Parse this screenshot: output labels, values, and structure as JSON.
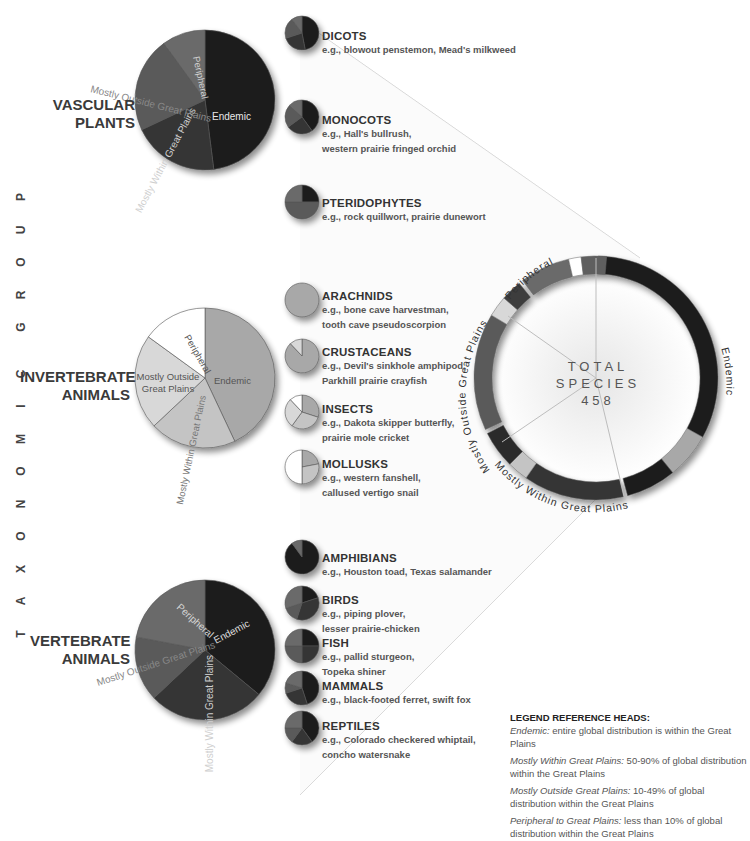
{
  "axis_title": "TAXONOMIC GROUP",
  "colors": {
    "endemic_dark": "#1e1e1e",
    "within_dark": "#353535",
    "outside_dark": "#5a5a5a",
    "peripheral_dark": "#6a6a6a",
    "endemic_light": "#a8a8a8",
    "within_light": "#c4c4c4",
    "outside_light": "#d8d8d8",
    "peripheral_light": "#ffffff"
  },
  "groups": [
    {
      "label_line1": "VASCULAR",
      "label_line2": "PLANTS",
      "slice_labels": [
        "Endemic",
        "Mostly Within Great Plains",
        "Mostly Outside Great Plains",
        "Peripheral"
      ],
      "subgroups": [
        {
          "name": "DICOTS",
          "ex1": "e.g., blowout penstemon, Mead's milkweed",
          "ex2": ""
        },
        {
          "name": "MONOCOTS",
          "ex1": "e.g., Hall's bullrush,",
          "ex2": "western prairie fringed orchid"
        },
        {
          "name": "PTERIDOPHYTES",
          "ex1": "e.g., rock quillwort, prairie dunewort",
          "ex2": ""
        }
      ]
    },
    {
      "label_line1": "INVERTEBRATE",
      "label_line2": "ANIMALS",
      "slice_labels": [
        "Endemic",
        "Mostly Within Great Plains",
        "Mostly Outside",
        "Great Plains",
        "Peripheral"
      ],
      "subgroups": [
        {
          "name": "ARACHNIDS",
          "ex1": "e.g., bone cave harvestman,",
          "ex2": "tooth cave pseudoscorpion"
        },
        {
          "name": "CRUSTACEANS",
          "ex1": "e.g., Devil's sinkhole amphipod,",
          "ex2": "Parkhill prairie crayfish"
        },
        {
          "name": "INSECTS",
          "ex1": "e.g., Dakota skipper butterfly,",
          "ex2": "prairie mole cricket"
        },
        {
          "name": "MOLLUSKS",
          "ex1": "e.g., western fanshell,",
          "ex2": "callused vertigo snail"
        }
      ]
    },
    {
      "label_line1": "VERTEBRATE",
      "label_line2": "ANIMALS",
      "slice_labels": [
        "Endemic",
        "Mostly Within Great Plains",
        "Mostly Outside Great Plains",
        "Peripheral"
      ],
      "subgroups": [
        {
          "name": "AMPHIBIANS",
          "ex1": "e.g., Houston toad, Texas salamander",
          "ex2": ""
        },
        {
          "name": "BIRDS",
          "ex1": "e.g., piping plover,",
          "ex2": "lesser prairie-chicken"
        },
        {
          "name": "FISH",
          "ex1": "e.g., pallid sturgeon,",
          "ex2": "Topeka shiner"
        },
        {
          "name": "MAMMALS",
          "ex1": "e.g., black-footed ferret, swift fox",
          "ex2": ""
        },
        {
          "name": "REPTILES",
          "ex1": "e.g., Colorado checkered whiptail,",
          "ex2": "concho watersnake"
        }
      ]
    }
  ],
  "total": {
    "line1": "TOTAL",
    "line2": "SPECIES",
    "value": "458",
    "ring_labels": {
      "endemic": "Endemic",
      "within": "Mostly Within Great Plains",
      "outside": "Mostly Outside Great Plains",
      "peripheral": "Peripheral"
    }
  },
  "legend": {
    "head": "LEGEND REFERENCE HEADS:",
    "items": [
      {
        "term": "Endemic:",
        "desc": " entire global distribution is within the Great Plains"
      },
      {
        "term": "Mostly Within Great Plains:",
        "desc": " 50-90% of global distribution within the Great Plains"
      },
      {
        "term": "Mostly Outside Great Plains:",
        "desc": " 10-49% of global distribution within the Great Plains"
      },
      {
        "term": "Peripheral to Great Plains:",
        "desc": " less than 10% of global distribution within the Great Plains"
      }
    ]
  },
  "chart_data": {
    "type": "pie",
    "categories": [
      "Endemic",
      "Mostly Within Great Plains",
      "Mostly Outside Great Plains",
      "Peripheral"
    ],
    "total_species": 458,
    "group_pies": [
      {
        "name": "Vascular Plants",
        "values": [
          48,
          20,
          22,
          10
        ]
      },
      {
        "name": "Invertebrate Animals",
        "values": [
          43,
          20,
          22,
          15
        ]
      },
      {
        "name": "Vertebrate Animals",
        "values": [
          36,
          27,
          15,
          22
        ]
      }
    ],
    "subgroup_pies": [
      {
        "name": "Dicots",
        "group": "Vascular Plants",
        "values": [
          47,
          23,
          20,
          10
        ]
      },
      {
        "name": "Monocots",
        "group": "Vascular Plants",
        "values": [
          40,
          25,
          22,
          13
        ]
      },
      {
        "name": "Pteridophytes",
        "group": "Vascular Plants",
        "values": [
          25,
          0,
          50,
          25
        ]
      },
      {
        "name": "Arachnids",
        "group": "Invertebrate Animals",
        "values": [
          100,
          0,
          0,
          0
        ]
      },
      {
        "name": "Crustaceans",
        "group": "Invertebrate Animals",
        "values": [
          88,
          0,
          12,
          0
        ]
      },
      {
        "name": "Insects",
        "group": "Invertebrate Animals",
        "values": [
          30,
          30,
          28,
          12
        ]
      },
      {
        "name": "Mollusks",
        "group": "Invertebrate Animals",
        "values": [
          22,
          28,
          0,
          50
        ]
      },
      {
        "name": "Amphibians",
        "group": "Vertebrate Animals",
        "values": [
          90,
          0,
          0,
          10
        ]
      },
      {
        "name": "Birds",
        "group": "Vertebrate Animals",
        "values": [
          20,
          35,
          15,
          30
        ]
      },
      {
        "name": "Fish",
        "group": "Vertebrate Animals",
        "values": [
          25,
          25,
          25,
          25
        ]
      },
      {
        "name": "Mammals",
        "group": "Vertebrate Animals",
        "values": [
          45,
          25,
          10,
          20
        ]
      },
      {
        "name": "Reptiles",
        "group": "Vertebrate Animals",
        "values": [
          40,
          20,
          15,
          25
        ]
      }
    ],
    "total_ring": {
      "segments": [
        {
          "category": "Endemic",
          "group": "Vascular Plants",
          "deg": 118
        },
        {
          "category": "Endemic",
          "group": "Invertebrate Animals",
          "deg": 22
        },
        {
          "category": "Endemic",
          "group": "Vertebrate Animals",
          "deg": 24
        },
        {
          "category": "Mostly Within Great Plains",
          "group": "Vascular Plants",
          "deg": 48
        },
        {
          "category": "Mostly Within Great Plains",
          "group": "Invertebrate Animals",
          "deg": 10
        },
        {
          "category": "Mostly Within Great Plains",
          "group": "Vertebrate Animals",
          "deg": 18
        },
        {
          "category": "Mostly Outside Great Plains",
          "group": "Vascular Plants",
          "deg": 56
        },
        {
          "category": "Mostly Outside Great Plains",
          "group": "Invertebrate Animals",
          "deg": 10
        },
        {
          "category": "Mostly Outside Great Plains",
          "group": "Vertebrate Animals",
          "deg": 10
        },
        {
          "category": "Peripheral",
          "group": "Vascular Plants",
          "deg": 24
        },
        {
          "category": "Peripheral",
          "group": "Invertebrate Animals",
          "deg": 6
        },
        {
          "category": "Peripheral",
          "group": "Vertebrate Animals",
          "deg": 12
        }
      ]
    }
  }
}
